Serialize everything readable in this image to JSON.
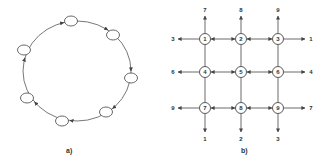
{
  "figure_a": {
    "caption": "a)",
    "type": "ring",
    "direction": "clockwise",
    "node_count": 7,
    "nodes": [
      {
        "id": "r1",
        "x": 71,
        "y": 21
      },
      {
        "id": "r2",
        "x": 113,
        "y": 35
      },
      {
        "id": "r3",
        "x": 131,
        "y": 78
      },
      {
        "id": "r4",
        "x": 106,
        "y": 112
      },
      {
        "id": "r5",
        "x": 62,
        "y": 121
      },
      {
        "id": "r6",
        "x": 27,
        "y": 98
      },
      {
        "id": "r7",
        "x": 24,
        "y": 50
      }
    ]
  },
  "figure_b": {
    "caption": "b)",
    "type": "2d-torus-mesh",
    "nodes": [
      {
        "label": "1",
        "x": 205,
        "y": 39
      },
      {
        "label": "2",
        "x": 241,
        "y": 39
      },
      {
        "label": "3",
        "x": 278,
        "y": 39
      },
      {
        "label": "4",
        "x": 205,
        "y": 72
      },
      {
        "label": "5",
        "x": 241,
        "y": 72
      },
      {
        "label": "6",
        "x": 278,
        "y": 72
      },
      {
        "label": "7",
        "x": 205,
        "y": 108
      },
      {
        "label": "8",
        "x": 241,
        "y": 108
      },
      {
        "label": "9",
        "x": 278,
        "y": 108
      }
    ],
    "wrap_top": [
      "7",
      "8",
      "9"
    ],
    "wrap_bottom": [
      "1",
      "2",
      "3"
    ],
    "wrap_left": [
      "3",
      "6",
      "9"
    ],
    "wrap_right": [
      "1",
      "4",
      "7"
    ]
  }
}
